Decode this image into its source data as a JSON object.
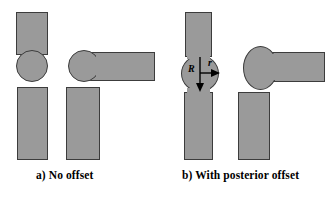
{
  "figure": {
    "width": 336,
    "height": 205,
    "background_color": "#ffffff",
    "shape_fill_color": "#9a9a9a",
    "shape_outline_color": "#3c3c3c",
    "label_color": "#000000"
  },
  "panels": [
    {
      "id": "panel-a",
      "caption": "a) No offset",
      "caption_x": 36,
      "caption_y": 176,
      "columns": [
        {
          "id": "column-a1",
          "name": "aligned-stem-column",
          "parts": [
            {
              "name": "upper-vertical-bar",
              "type": "bar",
              "x": 16,
              "y": 12,
              "w": 32,
              "h": 43
            },
            {
              "name": "femoral-head-circle",
              "type": "circle",
              "x": 16,
              "y": 50,
              "w": 32,
              "h": 32
            },
            {
              "name": "lower-vertical-bar",
              "type": "bar",
              "x": 17,
              "y": 87,
              "w": 31,
              "h": 73
            }
          ]
        },
        {
          "id": "column-a2",
          "name": "offset-neck-column",
          "parts": [
            {
              "name": "femoral-head-circle",
              "type": "circle",
              "x": 68,
              "y": 50,
              "w": 32,
              "h": 32
            },
            {
              "name": "horizontal-neck-bar",
              "type": "bar",
              "x": 84,
              "y": 52,
              "w": 71,
              "h": 29
            },
            {
              "name": "lower-vertical-bar",
              "type": "bar",
              "x": 66,
              "y": 87,
              "w": 34,
              "h": 73
            }
          ]
        }
      ]
    },
    {
      "id": "panel-b",
      "caption": "b) With posterior offset",
      "caption_x": 182,
      "caption_y": 176,
      "columns": [
        {
          "id": "column-b1",
          "name": "aligned-stem-column",
          "parts": [
            {
              "name": "upper-vertical-bar",
              "type": "bar",
              "x": 185,
              "y": 12,
              "w": 27,
              "h": 45
            },
            {
              "name": "femoral-head-ellipse",
              "type": "circle",
              "x": 181,
              "y": 55,
              "w": 38,
              "h": 37
            },
            {
              "name": "lower-vertical-bar",
              "type": "bar",
              "x": 184,
              "y": 92,
              "w": 29,
              "h": 68
            }
          ]
        },
        {
          "id": "column-b2",
          "name": "offset-neck-column",
          "parts": [
            {
              "name": "femoral-head-ellipse",
              "type": "circle",
              "x": 243,
              "y": 46,
              "w": 35,
              "h": 44
            },
            {
              "name": "horizontal-neck-bar",
              "type": "bar",
              "x": 272,
              "y": 52,
              "w": 53,
              "h": 30
            },
            {
              "name": "lower-vertical-bar",
              "type": "bar",
              "x": 238,
              "y": 92,
              "w": 32,
              "h": 68
            }
          ]
        }
      ],
      "dimensions": [
        {
          "name": "radius-R",
          "label": "R",
          "label_x": 192,
          "label_y": 69,
          "arrow": {
            "x1": 200,
            "y1": 57,
            "x2": 200,
            "y2": 90,
            "direction": "down"
          }
        },
        {
          "name": "radius-r",
          "label": "r",
          "label_x": 209,
          "label_y": 62,
          "arrow": {
            "x1": 200,
            "y1": 73,
            "x2": 219,
            "y2": 73,
            "direction": "right"
          }
        }
      ]
    }
  ]
}
